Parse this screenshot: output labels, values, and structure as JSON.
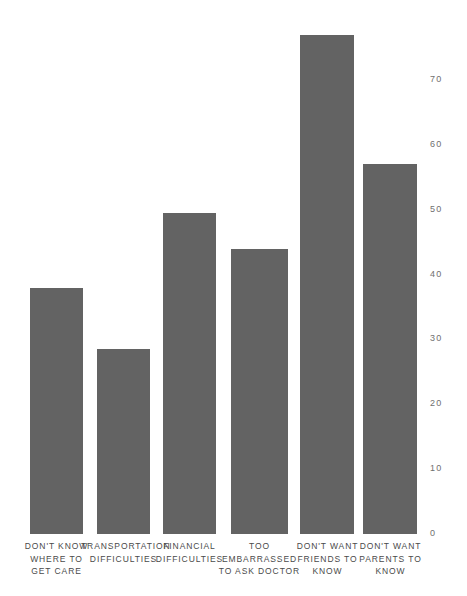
{
  "chart_data": {
    "type": "bar",
    "title": "",
    "subtitle": "",
    "xlabel": "",
    "ylabel": "",
    "ylim": [
      0,
      77
    ],
    "grid": false,
    "legend": null,
    "bar_color": "#636363",
    "background_color": "#ffffff",
    "text_color": "#4a4a4a",
    "tick_color": "#6f6f6f",
    "yticks": [
      "0",
      "10",
      "20",
      "30",
      "40",
      "50",
      "60",
      "70"
    ],
    "ytick_values": [
      0,
      10,
      20,
      30,
      40,
      50,
      60,
      70
    ],
    "categories": [
      "DON'T KNOW WHERE TO GET CARE",
      "TRANSPORTATION DIFFICULTIES",
      "FINANCIAL DIFFICULTIES",
      "TOO EMBARRASSED TO ASK DOCTOR",
      "DON'T WANT FRIENDS TO KNOW",
      "DON'T WANT PARENTS TO KNOW"
    ],
    "category_lines": [
      [
        "DON'T KNOW",
        "WHERE TO",
        "GET CARE"
      ],
      [
        "TRANSPORTATION",
        "DIFFICULTIES"
      ],
      [
        "FINANCIAL",
        "DIFFICULTIES"
      ],
      [
        "TOO",
        "EMBARRASSED",
        "TO ASK DOCTOR"
      ],
      [
        "DON'T WANT",
        "FRIENDS TO",
        "KNOW"
      ],
      [
        "DON'T WANT",
        "PARENTS TO",
        "KNOW"
      ]
    ],
    "values": [
      38,
      28.5,
      49.5,
      44,
      77,
      57
    ]
  }
}
